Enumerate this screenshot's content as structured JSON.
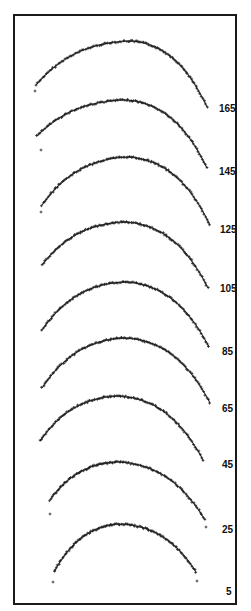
{
  "chart_data": {
    "type": "scatter",
    "title": "",
    "xlabel": "",
    "ylabel": "",
    "legend": [],
    "grid": false,
    "series": [
      {
        "name": "165",
        "label": "165",
        "left": [
          36,
          85
        ],
        "peak": [
          130,
          41
        ],
        "right": [
          207,
          107
        ],
        "outliers": [
          [
            35,
            91
          ]
        ],
        "label_pos": [
          219,
          112
        ]
      },
      {
        "name": "145",
        "label": "145",
        "left": [
          37,
          136
        ],
        "peak": [
          125,
          100
        ],
        "right": [
          207,
          168
        ],
        "outliers": [
          [
            41,
            150
          ]
        ],
        "label_pos": [
          219,
          175
        ]
      },
      {
        "name": "125",
        "label": "125",
        "left": [
          42,
          205
        ],
        "peak": [
          128,
          157
        ],
        "right": [
          210,
          225
        ],
        "outliers": [
          [
            41,
            212
          ]
        ],
        "label_pos": [
          220,
          233
        ]
      },
      {
        "name": "105",
        "label": "105",
        "left": [
          42,
          265
        ],
        "peak": [
          125,
          222
        ],
        "right": [
          208,
          288
        ],
        "outliers": [],
        "label_pos": [
          220,
          292
        ]
      },
      {
        "name": "85",
        "label": "85",
        "left": [
          42,
          330
        ],
        "peak": [
          125,
          282
        ],
        "right": [
          209,
          347
        ],
        "outliers": [],
        "label_pos": [
          222,
          355
        ]
      },
      {
        "name": "65",
        "label": "65",
        "left": [
          42,
          388
        ],
        "peak": [
          125,
          338
        ],
        "right": [
          210,
          403
        ],
        "outliers": [],
        "label_pos": [
          222,
          412
        ]
      },
      {
        "name": "45",
        "label": "45",
        "left": [
          40,
          441
        ],
        "peak": [
          118,
          396
        ],
        "right": [
          203,
          460
        ],
        "outliers": [],
        "label_pos": [
          222,
          468
        ]
      },
      {
        "name": "25",
        "label": "25",
        "left": [
          50,
          500
        ],
        "peak": [
          118,
          462
        ],
        "right": [
          205,
          520
        ],
        "outliers": [
          [
            50,
            514
          ],
          [
            206,
            527
          ]
        ],
        "label_pos": [
          222,
          533
        ]
      },
      {
        "name": "5",
        "label": "5",
        "left": [
          54,
          572
        ],
        "peak": [
          120,
          524
        ],
        "right": [
          196,
          572
        ],
        "outliers": [
          [
            53,
            582
          ],
          [
            197,
            581
          ]
        ],
        "label_pos": [
          226,
          595
        ]
      }
    ],
    "frame": {
      "x": 14,
      "y": 15,
      "width": 222,
      "height": 589
    }
  }
}
